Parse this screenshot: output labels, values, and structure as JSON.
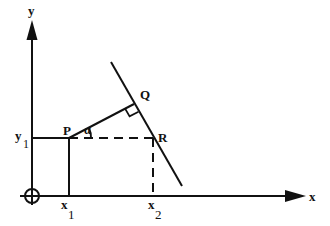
{
  "diagram": {
    "axes": {
      "x_label": "x",
      "y_label": "y",
      "origin_marker": "circle-crosshair"
    },
    "points": {
      "P": "P",
      "Q": "Q",
      "R": "R"
    },
    "angle_label": "α",
    "ticks": {
      "x1_base": "x",
      "x1_sub": "1",
      "x2_base": "x",
      "x2_sub": "2",
      "y1_base": "y",
      "y1_sub": "1"
    },
    "annotations": {
      "right_angle_at": "Q",
      "dashed_segments": [
        "P-R horizontal",
        "R-x2 vertical"
      ],
      "solid_segments": [
        "P-Q",
        "P-x1 vertical",
        "line through Q and R"
      ]
    },
    "colors": {
      "stroke": "#111111",
      "background": "#ffffff"
    }
  }
}
